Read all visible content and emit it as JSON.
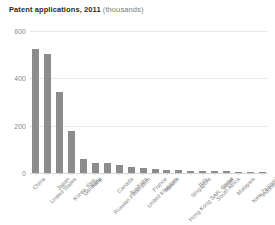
{
  "chart_data": {
    "type": "bar",
    "title": "Patent applications, 2011",
    "title_unit": "(thousands)",
    "xlabel": "",
    "ylabel": "",
    "ylim": [
      0,
      600
    ],
    "yticks": [
      0,
      200,
      400,
      600
    ],
    "grid": true,
    "legend": "none",
    "bar_color": "#8c8c8c",
    "categories": [
      "China",
      "United States",
      "Japan",
      "Korea, Rep.",
      "Germany",
      "India",
      "Russian Federation",
      "Canada",
      "Australia",
      "United Kingdom",
      "France",
      "Mexico",
      "Hong Kong SAR, China",
      "Singapore",
      "Italy",
      "South Africa",
      "Israel",
      "Malaysia",
      "New Zealand",
      "Indonesia"
    ],
    "values": [
      526,
      504,
      342,
      179,
      59,
      42,
      41,
      35,
      27,
      22,
      17,
      14,
      12,
      10,
      9,
      8,
      7,
      6,
      5,
      5
    ]
  }
}
